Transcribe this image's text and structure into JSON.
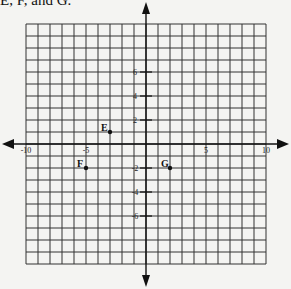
{
  "caption": "E, F, and G.",
  "chart_data": {
    "type": "scatter",
    "title": "",
    "xlabel": "",
    "ylabel": "",
    "xlim": [
      -10,
      10
    ],
    "ylim": [
      -10,
      10
    ],
    "grid": true,
    "x_tick_labels": [
      "-10",
      "-5",
      "5",
      "10"
    ],
    "x_tick_values": [
      -10,
      -5,
      5,
      10
    ],
    "y_tick_labels": [
      "6",
      "4",
      "2",
      "-2",
      "-4",
      "-6"
    ],
    "y_tick_values": [
      6,
      4,
      2,
      -2,
      -4,
      -6
    ],
    "points": [
      {
        "label": "E",
        "x": -3,
        "y": 1
      },
      {
        "label": "F",
        "x": -5,
        "y": -2
      },
      {
        "label": "G",
        "x": 2,
        "y": -2
      }
    ]
  }
}
